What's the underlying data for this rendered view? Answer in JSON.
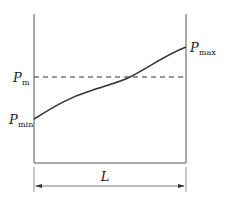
{
  "diagram": {
    "type": "pressure-distribution",
    "labels": {
      "p_max": {
        "main": "P",
        "sub": "max"
      },
      "p_m": {
        "main": "P",
        "sub": "m"
      },
      "p_min": {
        "main": "P",
        "sub": "min"
      },
      "length": "L"
    },
    "colors": {
      "line": "#333333",
      "axis": "#555555",
      "dash": "#333333"
    }
  }
}
